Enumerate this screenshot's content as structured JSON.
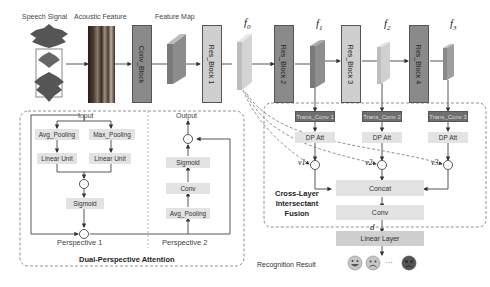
{
  "top_labels": {
    "speech_signal": "Speech Signal",
    "acoustic_feature": "Acoustic Feature",
    "feature_map": "Feature Map"
  },
  "blocks": {
    "conv_block": "Conv_Block",
    "res_block_1": "Res_Block 1",
    "res_block_2": "Res_Block 2",
    "res_block_3": "Res_Block 3",
    "res_block_4": "Res_Block 4"
  },
  "feature_labels": {
    "f0": "f0",
    "f1": "f1",
    "f2": "f2",
    "f3": "f3"
  },
  "dual_attention": {
    "title": "Dual-Perspective Attention",
    "input": "Input",
    "output": "Output",
    "p1": {
      "avg_pooling": "Avg_Pooling",
      "max_pooling": "Max_Pooling",
      "linear_unit_1": "Linear Unit",
      "linear_unit_2": "Linear Unit",
      "sigmoid": "Sigmoid",
      "label": "Perspective 1"
    },
    "p2": {
      "avg_pooling": "Avg_Pooling",
      "conv": "Conv",
      "sigmoid": "Sigmoid",
      "label": "Perspective 2"
    }
  },
  "fusion": {
    "title_lines": [
      "Cross-Layer",
      "Intersectant",
      "Fusion"
    ],
    "trans_conv": [
      "Trans_Conv 1",
      "Trans_Conv 2",
      "Trans_Conv 3"
    ],
    "dp_att": [
      "DP Att",
      "DP Att",
      "DP Att"
    ],
    "v_labels": [
      "v1",
      "v2",
      "v3"
    ],
    "concat": "Concat",
    "conv": "Conv",
    "d_label": "d"
  },
  "linear_layer": "Linear Layer",
  "recognition": {
    "label": "Recognition Result",
    "ellipsis": "···",
    "emotions": [
      "happy-face",
      "sad-face",
      "angry-face"
    ]
  },
  "operator_symbol": "·",
  "colors": {
    "dark_block": "#8a8a8a",
    "light_block": "#cfcfcf",
    "trans_conv": "#6f6f6f",
    "light_box": "#e3e3e3",
    "line": "#444444"
  }
}
